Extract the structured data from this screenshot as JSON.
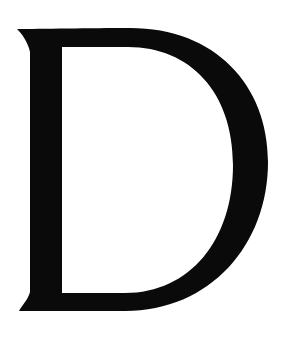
{
  "image": {
    "letter": "D",
    "description": "Large black serif capital letter D on white background",
    "colors": {
      "glyph": "#0a0a0a",
      "background": "#ffffff"
    }
  }
}
